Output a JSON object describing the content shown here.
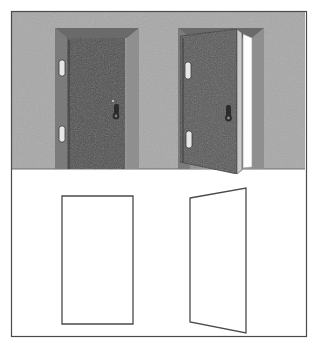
{
  "figure": {
    "canvas": {
      "width": 317,
      "height": 357
    },
    "border": {
      "label": "figure-border",
      "color": "#4a4a4a",
      "x": 11,
      "y": 11,
      "width": 295,
      "height": 325,
      "stroke_width": 1.2
    },
    "scene": {
      "wall": {
        "label": "wall",
        "color": "#a8a8a8",
        "x": 12,
        "y": 12,
        "width": 293,
        "height": 157
      },
      "floor": {
        "label": "floor",
        "color": "#ffffff",
        "x": 12,
        "y": 169,
        "width": 293,
        "height": 166
      },
      "floor_line": {
        "label": "floor-line",
        "color": "#6e6e6e",
        "y": 169
      }
    },
    "colors": {
      "wall_gray": "#a8a8a8",
      "door_panel_dark": "#4e4e4e",
      "door_panel_open": "#585858",
      "frame_light": "#8e8e8e",
      "frame_mid": "#7b7b7b",
      "frame_dark": "#5e5e5e",
      "frame_top": "#6a6a6a",
      "hardware_light": "#e6e6e6",
      "hardware_dark": "#2b2b2b",
      "opening_white": "#fdfdfd",
      "outline_stroke": "#4a4a4a",
      "background": "#ffffff"
    },
    "closed_door": {
      "label": "closed-door",
      "state": "closed",
      "hinge_side": "left",
      "frame": {
        "x": 55,
        "y": 28,
        "width": 84,
        "height": 141
      },
      "panel": {
        "x": 67,
        "y": 38,
        "width": 58,
        "height": 131
      },
      "hinges": [
        {
          "label": "hinge-upper",
          "x": 59,
          "y": 60,
          "width": 6,
          "height": 16
        },
        {
          "label": "hinge-lower",
          "x": 59,
          "y": 126,
          "width": 6,
          "height": 16
        }
      ],
      "handle": {
        "label": "door-handle",
        "x": 113,
        "y": 104,
        "width": 7,
        "height": 13
      }
    },
    "open_door": {
      "label": "open-door",
      "state": "open",
      "hinge_side": "right",
      "swing": "toward viewer",
      "frame": {
        "x": 178,
        "y": 28,
        "width": 86,
        "height": 141
      },
      "panel_points": "180,36 236,30 236,172 180,161",
      "opening_points": "243,34 254,37 254,165 243,167",
      "hinges": [
        {
          "label": "hinge-upper",
          "x": 186,
          "y": 62,
          "width": 6,
          "height": 17
        },
        {
          "label": "hinge-lower",
          "x": 186,
          "y": 130,
          "width": 6,
          "height": 17
        }
      ],
      "handle": {
        "label": "door-handle",
        "x": 226,
        "y": 106,
        "width": 7,
        "height": 14
      }
    },
    "plan_closed": {
      "label": "plan-closed-door",
      "shape": "rectangle",
      "points": "62,196 133,196 133,324 62,324",
      "stroke": "#4a4a4a",
      "fill": "#ffffff"
    },
    "plan_open": {
      "label": "plan-open-door",
      "shape": "trapezoid",
      "points": "190,198 246,188 246,333 190,322",
      "stroke": "#4a4a4a",
      "fill": "#ffffff"
    }
  }
}
